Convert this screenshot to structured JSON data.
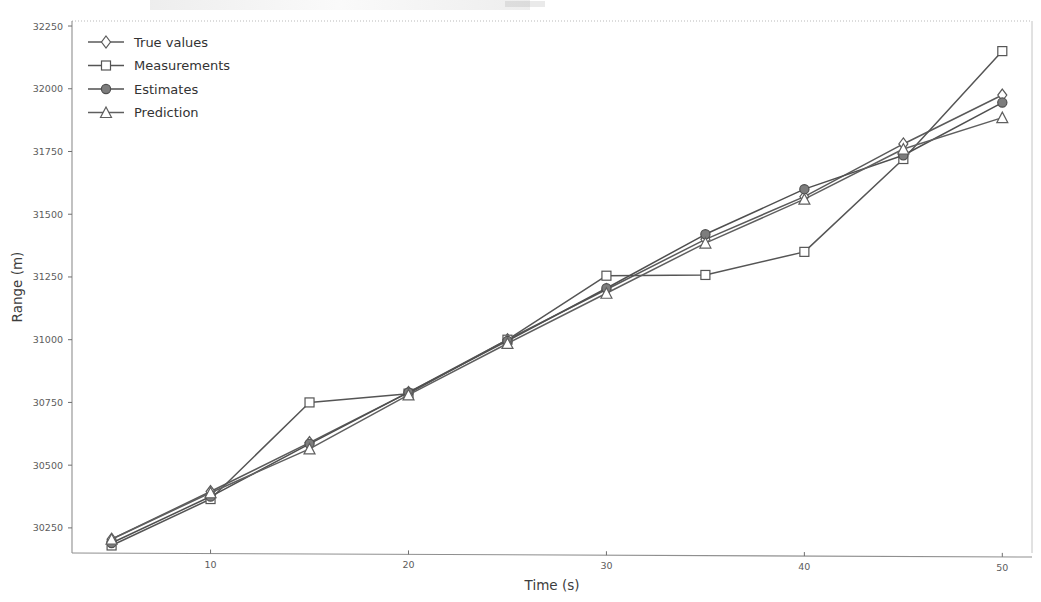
{
  "figure": {
    "background_color": "#ffffff",
    "plot_area": {
      "left": 72,
      "top": 21,
      "right": 1032,
      "bottom": 553
    },
    "axis_color": "#6f6f6f",
    "grid": false
  },
  "chart_data": {
    "type": "line",
    "title": "",
    "xlabel": "Time (s)",
    "ylabel": "Range (m)",
    "xlim": [
      3.0,
      51.5
    ],
    "ylim": [
      30150,
      32270
    ],
    "xticks": [
      10,
      20,
      30,
      40,
      50
    ],
    "xtick_labels": [
      "10",
      "20",
      "30",
      "40",
      "50"
    ],
    "yticks": [
      30250,
      30500,
      30750,
      31000,
      31250,
      31500,
      31750,
      32000,
      32250
    ],
    "ytick_labels": [
      "30250",
      "30500",
      "30750",
      "31000",
      "31250",
      "31500",
      "31750",
      "32000",
      "32250"
    ],
    "grid": false,
    "legend_position": "upper left",
    "x": [
      5,
      10,
      15,
      20,
      25,
      30,
      35,
      40,
      45,
      50
    ],
    "series": [
      {
        "name": "True values",
        "marker": "diamond",
        "marker_fill": "#ffffff",
        "color": "#5a5a5a",
        "values": [
          30205,
          30395,
          30590,
          30790,
          31000,
          31200,
          31400,
          31570,
          31780,
          31975
        ]
      },
      {
        "name": "Measurements",
        "marker": "square",
        "marker_fill": "#ffffff",
        "color": "#555555",
        "values": [
          30180,
          30365,
          30750,
          30785,
          31000,
          31255,
          31258,
          31350,
          31720,
          32150
        ]
      },
      {
        "name": "Estimates",
        "marker": "circle",
        "marker_fill": "#7d7d7d",
        "color": "#4f4f4f",
        "values": [
          30190,
          30375,
          30585,
          30790,
          30995,
          31205,
          31420,
          31600,
          31735,
          31945
        ]
      },
      {
        "name": "Prediction",
        "marker": "triangle",
        "marker_fill": "#ffffff",
        "color": "#5f5f5f",
        "values": [
          30205,
          30390,
          30565,
          30780,
          30985,
          31185,
          31385,
          31560,
          31760,
          31885
        ]
      }
    ]
  },
  "legend": {
    "entries": [
      {
        "label": "True values"
      },
      {
        "label": "Measurements"
      },
      {
        "label": "Estimates"
      },
      {
        "label": "Prediction"
      }
    ]
  }
}
